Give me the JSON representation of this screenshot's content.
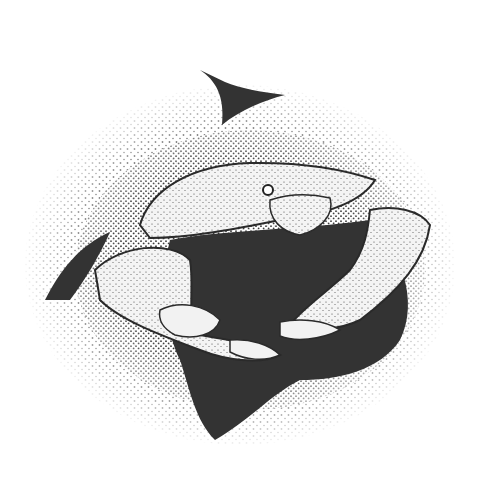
{
  "artwork": {
    "subject": "crab",
    "style": "stipple ink illustration",
    "colors": {
      "background": "#ffffff",
      "ink": "#2a2a2a",
      "shadow": "#333333",
      "highlight": "#f2f2f2"
    }
  }
}
